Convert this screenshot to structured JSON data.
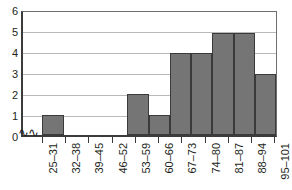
{
  "chart_data": {
    "type": "bar",
    "title": "",
    "subtitle": "",
    "xlabel": "",
    "ylabel": "",
    "categories": [
      "25–31",
      "32–38",
      "39–45",
      "46–52",
      "53–59",
      "60–66",
      "67–73",
      "74–80",
      "81–87",
      "88–94",
      "95–101"
    ],
    "values": [
      1,
      0,
      0,
      0,
      2,
      1,
      4,
      4,
      5,
      5,
      3
    ],
    "ylim": [
      0,
      6
    ],
    "y_ticks": [
      "6",
      "5",
      "4",
      "3",
      "2",
      "1",
      "0"
    ],
    "y_tick_values": [
      6,
      5,
      4,
      3,
      2,
      1,
      0
    ],
    "grid": true,
    "legend": false,
    "legend_position": "none",
    "axis_break": "≈",
    "annotations": [
      "axis-break-on-x-axis-near-origin"
    ],
    "bar_fill_color": "#757575",
    "bar_border_color": "#3a3a3a",
    "gridline_color": "#b9b9b9",
    "axis_color": "#3b3b3b",
    "background_color": "#ffffff",
    "text_color": "#231f20"
  }
}
